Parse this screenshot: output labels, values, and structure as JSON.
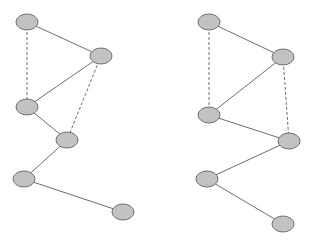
{
  "style": {
    "background": "#ffffff",
    "node_fill": "#c2c2c2",
    "node_stroke": "#707070",
    "edge_color": "#6e6e6e",
    "node_rx": 11,
    "node_ry": 8
  },
  "graphs": [
    {
      "name": "left-graph",
      "nodes": [
        {
          "id": "a",
          "x": 27,
          "y": 22
        },
        {
          "id": "b",
          "x": 101,
          "y": 56
        },
        {
          "id": "c",
          "x": 27,
          "y": 107
        },
        {
          "id": "d",
          "x": 67,
          "y": 140
        },
        {
          "id": "e",
          "x": 24,
          "y": 179
        },
        {
          "id": "f",
          "x": 123,
          "y": 212
        }
      ],
      "edges": [
        {
          "from": "a",
          "to": "b",
          "style": "solid"
        },
        {
          "from": "b",
          "to": "c",
          "style": "solid"
        },
        {
          "from": "c",
          "to": "d",
          "style": "solid"
        },
        {
          "from": "d",
          "to": "e",
          "style": "solid"
        },
        {
          "from": "e",
          "to": "f",
          "style": "solid"
        },
        {
          "from": "a",
          "to": "c",
          "style": "dashed"
        },
        {
          "from": "b",
          "to": "d",
          "style": "dashed"
        }
      ]
    },
    {
      "name": "right-graph",
      "nodes": [
        {
          "id": "a",
          "x": 209,
          "y": 22
        },
        {
          "id": "b",
          "x": 283,
          "y": 57
        },
        {
          "id": "c",
          "x": 209,
          "y": 115
        },
        {
          "id": "d",
          "x": 289,
          "y": 141
        },
        {
          "id": "e",
          "x": 207,
          "y": 179
        },
        {
          "id": "f",
          "x": 283,
          "y": 224
        }
      ],
      "edges": [
        {
          "from": "a",
          "to": "b",
          "style": "solid"
        },
        {
          "from": "b",
          "to": "c",
          "style": "solid"
        },
        {
          "from": "c",
          "to": "d",
          "style": "solid"
        },
        {
          "from": "d",
          "to": "e",
          "style": "solid"
        },
        {
          "from": "e",
          "to": "f",
          "style": "solid"
        },
        {
          "from": "a",
          "to": "c",
          "style": "dashed"
        },
        {
          "from": "b",
          "to": "d",
          "style": "dashed"
        }
      ]
    }
  ]
}
